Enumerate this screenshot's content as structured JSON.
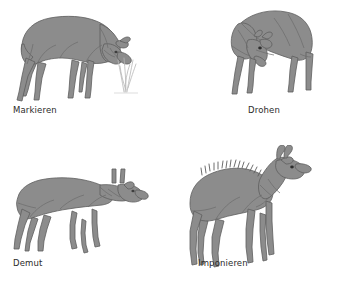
{
  "plate": {
    "title": "Verhaltensweisen",
    "background_color": "#ffffff",
    "body_fill_color": "#8c8c8c",
    "body_fill_light": "#9a9a9a",
    "outline_color": "#5e5e5e",
    "label_color": "#2b2b2b",
    "grass_color": "#b6b6b6",
    "columns": 2,
    "rows": 2
  },
  "panels": [
    {
      "id": "markieren",
      "label": "Markieren",
      "icon_name": "chamois-marking-figure",
      "description": "Gams mit gesenktem Kopf markiert an Grashalmen"
    },
    {
      "id": "drohen",
      "label": "Drohen",
      "icon_name": "chamois-threatening-figure",
      "description": "Gams mit tief gesenktem Kopf in Drohhaltung, frontal"
    },
    {
      "id": "demut",
      "label": "Demut",
      "icon_name": "chamois-submission-figure",
      "description": "Junge Gams in geduckter Demutshaltung"
    },
    {
      "id": "imponieren",
      "label": "Imponieren",
      "icon_name": "chamois-display-figure",
      "description": "Gams mit aufgestelltem Rueckenkamm und erhobenem Kopf"
    }
  ]
}
